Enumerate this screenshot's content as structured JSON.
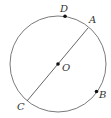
{
  "diagram": {
    "type": "circle-geometry",
    "colors": {
      "stroke": "#7a7a7a",
      "point": "#111111",
      "label": "#333333"
    },
    "circle": {
      "center_label": "O",
      "cx": 58,
      "cy": 64,
      "r": 48
    },
    "points": [
      {
        "label": "D",
        "x": 65,
        "y": 16,
        "label_x": 60,
        "label_y": 12
      },
      {
        "label": "A",
        "label_x": 89,
        "label_y": 23
      },
      {
        "label": "O",
        "x": 58,
        "y": 64,
        "label_x": 62,
        "label_y": 71
      },
      {
        "label": "B",
        "x": 96,
        "y": 91,
        "label_x": 99,
        "label_y": 98
      },
      {
        "label": "C",
        "label_x": 17,
        "label_y": 110
      }
    ],
    "segments": [
      {
        "name": "diameter-AC",
        "from": "A",
        "to": "C"
      }
    ]
  }
}
